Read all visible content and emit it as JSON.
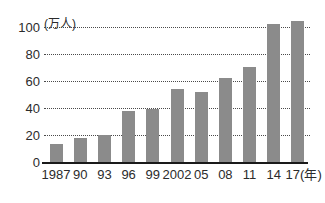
{
  "chart_data": {
    "type": "bar",
    "title": "",
    "subtitle": "",
    "xlabel": "(年)",
    "ylabel": "(万人)",
    "unit_label": "(万人)",
    "year_label": "(年)",
    "categories": [
      "1987",
      "90",
      "93",
      "96",
      "99",
      "2002",
      "05",
      "08",
      "11",
      "14",
      "17"
    ],
    "values": [
      13,
      18,
      20,
      38,
      39,
      54,
      52,
      62,
      70,
      102,
      104
    ],
    "series": [
      {
        "name": "",
        "values": [
          13,
          18,
          20,
          38,
          39,
          54,
          52,
          62,
          70,
          102,
          104
        ]
      }
    ],
    "ylim": [
      0,
      108
    ],
    "ytick_values": [
      0,
      20,
      40,
      60,
      80,
      100
    ],
    "ytick_labels": [
      "0",
      "20",
      "40",
      "60",
      "80",
      "100"
    ],
    "grid": true,
    "grid_axis": "y",
    "legend": false,
    "legend_position": "none",
    "bar_color": "#8b8b8b",
    "axis_color": "#1a1a1a",
    "grid_color": "#4a4a4a",
    "background": "#ffffff"
  },
  "axes": {
    "y_top_label_with_unit": "100 (万人)"
  }
}
